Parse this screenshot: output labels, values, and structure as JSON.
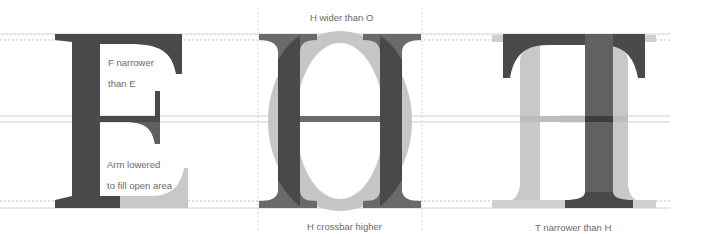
{
  "diagram": {
    "colors": {
      "dark": "#4a4a4a",
      "medium": "#6e6e6e",
      "light": "#c8c8c8",
      "guide_solid": "#cfcfcf",
      "guide_dotted": "#bdbdbd",
      "label": "#6a6a6a"
    },
    "guidelines": {
      "cap_solid_y": 34,
      "cap_dotted_y": 40,
      "mid_upper_y": 116,
      "mid_lower_y": 122,
      "base_dotted_y": 201,
      "base_solid_y": 208
    },
    "panels": [
      {
        "id": "e-vs-f",
        "letters": [
          "E",
          "F"
        ],
        "annotations": [
          {
            "lines": [
              "F narrower",
              "than E"
            ]
          },
          {
            "lines": [
              "Arm lowered",
              "to fill open area"
            ]
          }
        ]
      },
      {
        "id": "h-vs-o",
        "letters": [
          "H",
          "O"
        ],
        "top_label": "H wider than O",
        "bottom_label": "H crossbar higher"
      },
      {
        "id": "t-vs-h",
        "letters": [
          "T",
          "H"
        ],
        "bottom_label": "T narrower than H"
      }
    ]
  }
}
